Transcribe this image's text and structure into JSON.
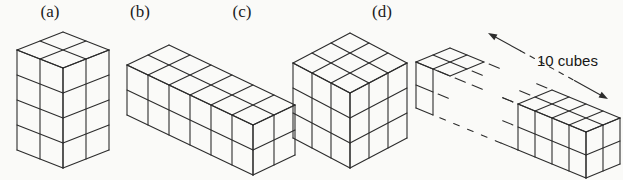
{
  "background": "#fafaf8",
  "line_color": "#2c2c2c",
  "figures": [
    {
      "id": "a",
      "label": "(a)",
      "type": "cuboid",
      "dims": {
        "length": 2,
        "depth": 2,
        "height": 4
      }
    },
    {
      "id": "b",
      "label": "(b)",
      "type": "cuboid",
      "dims": {
        "length": 6,
        "depth": 2,
        "height": 2
      }
    },
    {
      "id": "c",
      "label": "(c)",
      "type": "cuboid",
      "dims": {
        "length": 3,
        "depth": 3,
        "height": 3
      }
    },
    {
      "id": "d",
      "label": "(d)",
      "type": "broken-cuboid",
      "dims": {
        "length": 10,
        "depth": 2,
        "height": 2
      },
      "annotation": {
        "text": "10 cubes"
      }
    }
  ]
}
